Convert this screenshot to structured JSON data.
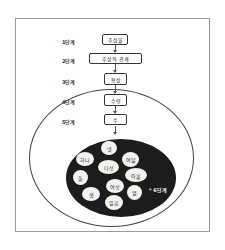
{
  "diagram": {
    "steps": [
      {
        "label": "1단계",
        "box": "추상물"
      },
      {
        "label": "2단계",
        "box": "추상적 관계"
      },
      {
        "label": "3단계",
        "box": "형상"
      },
      {
        "label": "4단계",
        "box": "수량"
      },
      {
        "label": "5단계",
        "box": "수"
      }
    ],
    "step6": {
      "label": "* 6단계",
      "numbers": [
        "넷",
        "하나",
        "여덟",
        "다섯",
        "둘",
        "아홉",
        "여섯",
        "셋",
        "열",
        "일곱"
      ]
    },
    "colors": {
      "frame": "#9a9a9a",
      "box_border": "#333333",
      "black_ellipse": "#1c1c1c",
      "number_circle": "#f2f2ee"
    }
  }
}
